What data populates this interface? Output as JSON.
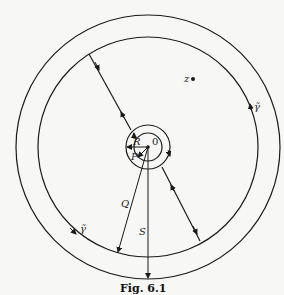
{
  "figure": {
    "caption": "Fig. 6.1",
    "labels": {
      "z": "z",
      "origin": "0",
      "R": "R",
      "P": "P",
      "Q": "Q",
      "S": "S",
      "gamma_right": "γ̃",
      "gamma_left": "γ̃"
    },
    "center": [
      148,
      147
    ],
    "radii": {
      "P": 14,
      "R": 22,
      "Q": 110,
      "S": 132
    },
    "colors": {
      "stroke": "#1a1a1a",
      "background": "#f7f7f5"
    }
  }
}
